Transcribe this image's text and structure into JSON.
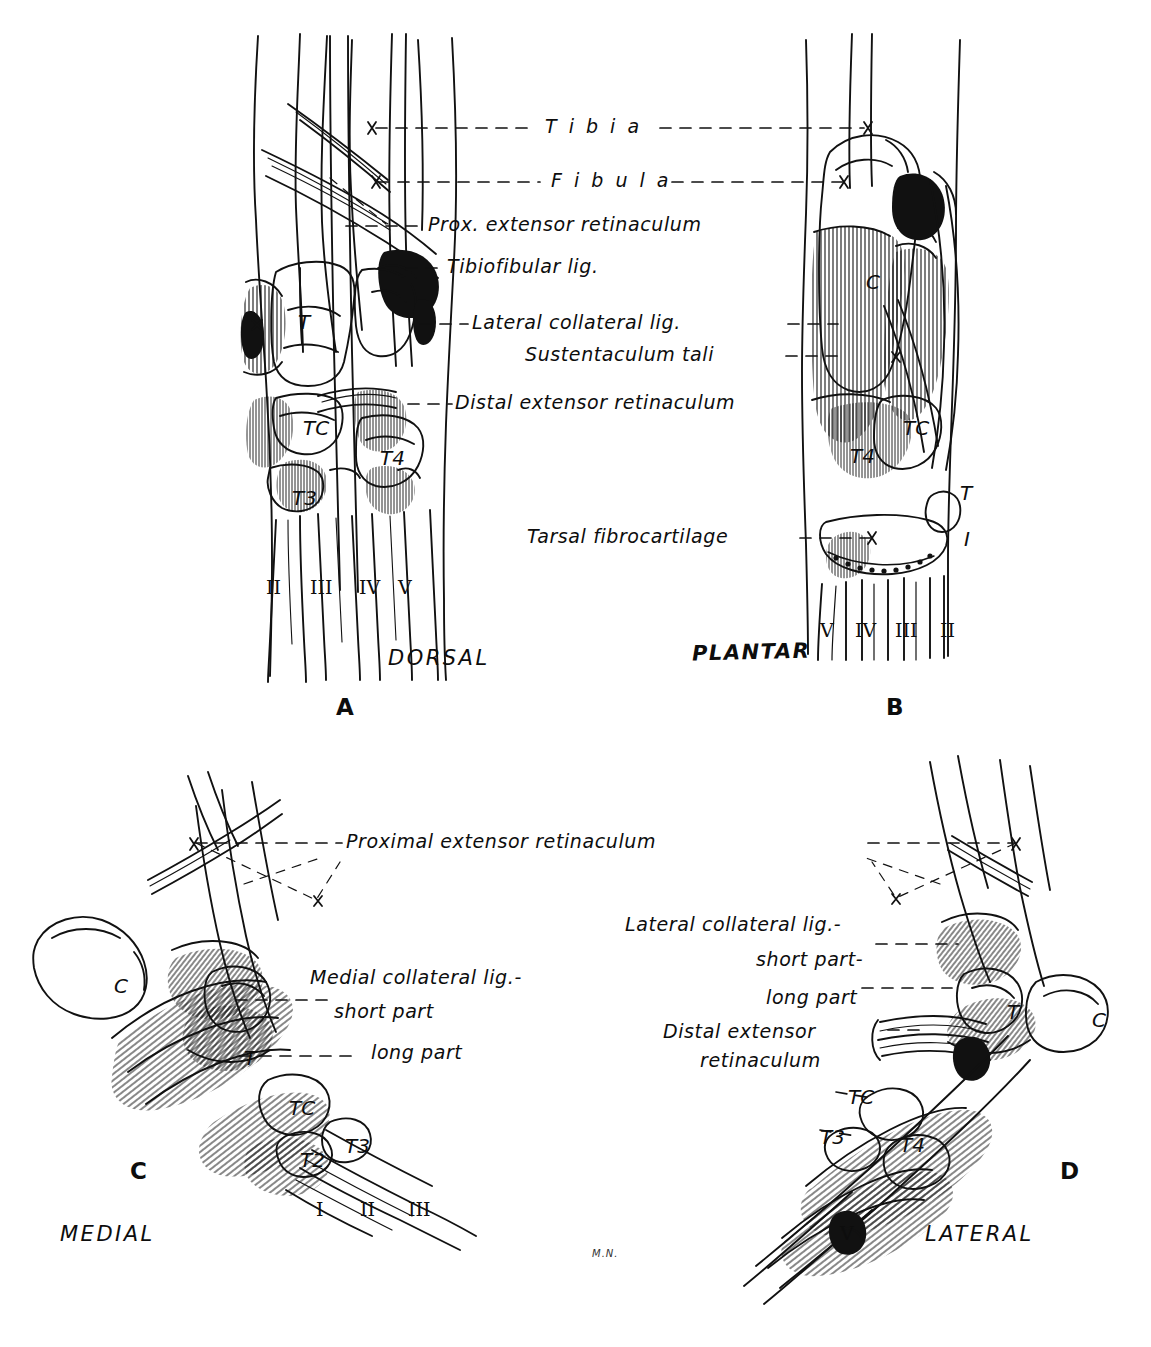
{
  "figure": {
    "background": "#ffffff",
    "ink": "#0d0d0d"
  },
  "panels": [
    {
      "id": "A",
      "letter": "A",
      "view_name": "DORSAL",
      "bone_labels": [
        "T",
        "TC",
        "T3",
        "T4"
      ],
      "digits": [
        "II",
        "III",
        "IV",
        "V"
      ]
    },
    {
      "id": "B",
      "letter": "B",
      "view_name": "PLANTAR",
      "bone_labels": [
        "C",
        "TC",
        "T4",
        "T",
        "I"
      ],
      "digits": [
        "V",
        "IV",
        "III",
        "II"
      ]
    },
    {
      "id": "C",
      "letter": "C",
      "view_name": "MEDIAL",
      "bone_labels": [
        "C",
        "T",
        "TC",
        "T2",
        "T3"
      ],
      "digits": [
        "I",
        "II",
        "III"
      ]
    },
    {
      "id": "D",
      "letter": "D",
      "view_name": "LATERAL",
      "bone_labels": [
        "T",
        "C",
        "TC",
        "T3",
        "T4"
      ],
      "digits": [
        "V"
      ]
    }
  ],
  "leader_labels": {
    "tibia": "T i b i a",
    "fibula": "F i b u l a",
    "prox_extensor_retinaculum_short": "Prox. extensor retinaculum",
    "tibiofibular_lig": "Tibiofibular lig.",
    "lateral_collateral_lig": "Lateral collateral lig.",
    "sustentaculum_tali": "Sustentaculum tali",
    "distal_extensor_retinaculum": "Distal extensor retinaculum",
    "tarsal_fibrocartilage": "Tarsal fibrocartilage",
    "proximal_extensor_retinaculum": "Proximal extensor retinaculum",
    "medial_collateral_lig": "Medial collateral lig.-",
    "medial_short_part": "short part",
    "medial_long_part": "long part",
    "lateral_collateral_lig_d": "Lateral collateral lig.-",
    "lateral_short_part": "short part-",
    "lateral_long_part": "long part",
    "distal_extensor_d_line1": "Distal extensor",
    "distal_extensor_d_line2": "retinaculum"
  },
  "signature": "M.N.",
  "caption": ""
}
